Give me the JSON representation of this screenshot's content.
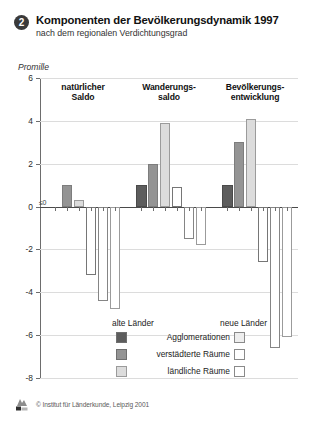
{
  "header": {
    "number": "2",
    "title": "Komponenten der Bevölkerungsdynamik 1997",
    "subtitle": "nach dem regionalen Verdichtungsgrad"
  },
  "footer": {
    "copyright": "© Institut für Länderkunde, Leipzig 2001",
    "logo_icon": "ifl-logo-icon"
  },
  "legend": {
    "old_header": "alte Länder",
    "new_header": "neue Länder",
    "items": [
      {
        "label": "Agglomerationen",
        "fill": "#5d5d5d"
      },
      {
        "label": "verstädterte Räume",
        "fill": "#949494"
      },
      {
        "label": "ländliche Räume",
        "fill": "#dcdcdc"
      }
    ]
  },
  "chart_data": {
    "type": "bar",
    "title": "Komponenten der Bevölkerungsdynamik 1997",
    "subtitle": "nach dem regionalen Verdichtungsgrad",
    "ylabel": "Promille",
    "xlabel": "",
    "ylim": [
      -8,
      6
    ],
    "yticks": [
      6,
      4,
      2,
      0,
      -2,
      -4,
      -6,
      -8
    ],
    "ytick_labels": [
      "6",
      "4",
      "2",
      "0",
      "-2",
      "-4",
      "-6",
      "-8"
    ],
    "grid": true,
    "legend_position": "bottom-center",
    "annotations": [
      {
        "text": "≤0",
        "group": "natürlicher Saldo",
        "series": "Agglomerationen (alte Länder)",
        "value": 0
      }
    ],
    "categories": [
      "natürlicher Saldo",
      "Wanderungssaldo",
      "Bevölkerungsentwicklung"
    ],
    "series": [
      {
        "name": "Agglomerationen (alte Länder)",
        "fill": "#5d5d5d",
        "values": [
          0.0,
          1.0,
          1.0
        ]
      },
      {
        "name": "verstädterte Räume (alte Länder)",
        "fill": "#949494",
        "values": [
          1.0,
          2.0,
          3.0
        ]
      },
      {
        "name": "ländliche Räume (alte Länder)",
        "fill": "#dcdcdc",
        "values": [
          0.3,
          3.9,
          4.1
        ]
      },
      {
        "name": "Agglomerationen (neue Länder)",
        "fill": "#ffffff",
        "values": [
          -3.2,
          0.9,
          -2.6
        ]
      },
      {
        "name": "verstädterte Räume (neue Länder)",
        "fill": "#ffffff",
        "values": [
          -4.4,
          -1.5,
          -6.6
        ]
      },
      {
        "name": "ländliche Räume (neue Länder)",
        "fill": "#ffffff",
        "values": [
          -4.8,
          -1.8,
          -6.1
        ]
      }
    ]
  }
}
